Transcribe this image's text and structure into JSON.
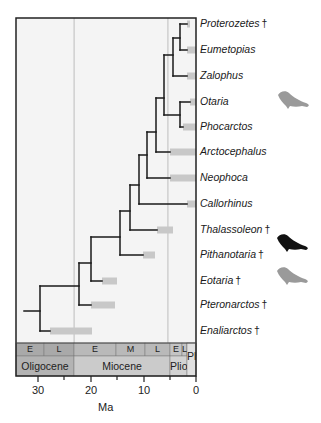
{
  "figure": {
    "type": "phylogenetic-tree",
    "frame": {
      "left": 16,
      "right": 196,
      "top": 18,
      "bottom": 343
    },
    "scale": {
      "x0_px": 196,
      "px_per_ma": 5.3
    },
    "boundary_lines_ma": [
      23.0,
      5.3
    ],
    "colors": {
      "branch": "#1a1a1a",
      "range_bar": "#c8c8c8",
      "frame_fill": "#f4f4f4",
      "boundary_line": "#b0b0b0",
      "silhouette_grey": "#9a9a9a",
      "silhouette_black": "#111111"
    }
  },
  "taxa": [
    {
      "name": "Proterozetes",
      "extinct": true,
      "y": 24,
      "bar": [
        187,
        190
      ]
    },
    {
      "name": "Eumetopias",
      "extinct": false,
      "y": 50,
      "bar": [
        187,
        196
      ]
    },
    {
      "name": "Zalophus",
      "extinct": false,
      "y": 76,
      "bar": [
        187,
        196
      ]
    },
    {
      "name": "Otaria",
      "extinct": false,
      "y": 102,
      "bar": [
        190,
        196
      ]
    },
    {
      "name": "Phocarctos",
      "extinct": false,
      "y": 127,
      "bar": [
        183,
        196
      ]
    },
    {
      "name": "Arctocephalus",
      "extinct": false,
      "y": 152,
      "bar": [
        170,
        196
      ]
    },
    {
      "name": "Neophoca",
      "extinct": false,
      "y": 178,
      "bar": [
        170,
        196
      ]
    },
    {
      "name": "Callorhinus",
      "extinct": false,
      "y": 204,
      "bar": [
        187,
        196
      ]
    },
    {
      "name": "Thalassoleon",
      "extinct": true,
      "y": 230,
      "bar": [
        157,
        173
      ]
    },
    {
      "name": "Pithanotaria",
      "extinct": true,
      "y": 255,
      "bar": [
        143,
        155
      ]
    },
    {
      "name": "Eotaria",
      "extinct": true,
      "y": 281,
      "bar": [
        102,
        117
      ]
    },
    {
      "name": "Pteronarctos",
      "extinct": true,
      "y": 305,
      "bar": [
        91,
        115
      ]
    },
    {
      "name": "Enaliarctos",
      "extinct": true,
      "y": 331,
      "bar": [
        50,
        92
      ]
    }
  ],
  "branches": [
    {
      "x1": 24,
      "y1": 311,
      "x2": 40,
      "y2": 311
    },
    {
      "x1": 40,
      "y1": 286,
      "x2": 40,
      "y2": 331
    },
    {
      "x1": 40,
      "y1": 331,
      "x2": 50,
      "y2": 331
    },
    {
      "x1": 40,
      "y1": 286,
      "x2": 79,
      "y2": 286
    },
    {
      "x1": 79,
      "y1": 263,
      "x2": 79,
      "y2": 305
    },
    {
      "x1": 79,
      "y1": 305,
      "x2": 91,
      "y2": 305
    },
    {
      "x1": 79,
      "y1": 263,
      "x2": 91,
      "y2": 263
    },
    {
      "x1": 91,
      "y1": 237,
      "x2": 91,
      "y2": 281
    },
    {
      "x1": 91,
      "y1": 281,
      "x2": 102,
      "y2": 281
    },
    {
      "x1": 91,
      "y1": 237,
      "x2": 120,
      "y2": 237
    },
    {
      "x1": 120,
      "y1": 211,
      "x2": 120,
      "y2": 255
    },
    {
      "x1": 120,
      "y1": 255,
      "x2": 143,
      "y2": 255
    },
    {
      "x1": 120,
      "y1": 211,
      "x2": 130,
      "y2": 211
    },
    {
      "x1": 130,
      "y1": 185,
      "x2": 130,
      "y2": 230
    },
    {
      "x1": 130,
      "y1": 230,
      "x2": 157,
      "y2": 230
    },
    {
      "x1": 130,
      "y1": 185,
      "x2": 139,
      "y2": 185
    },
    {
      "x1": 139,
      "y1": 155,
      "x2": 139,
      "y2": 204
    },
    {
      "x1": 139,
      "y1": 204,
      "x2": 187,
      "y2": 204
    },
    {
      "x1": 139,
      "y1": 155,
      "x2": 147,
      "y2": 155
    },
    {
      "x1": 147,
      "y1": 132,
      "x2": 147,
      "y2": 178
    },
    {
      "x1": 147,
      "y1": 178,
      "x2": 170,
      "y2": 178
    },
    {
      "x1": 147,
      "y1": 132,
      "x2": 156,
      "y2": 132
    },
    {
      "x1": 156,
      "y1": 98,
      "x2": 156,
      "y2": 152
    },
    {
      "x1": 156,
      "y1": 152,
      "x2": 170,
      "y2": 152
    },
    {
      "x1": 156,
      "y1": 98,
      "x2": 164,
      "y2": 98
    },
    {
      "x1": 164,
      "y1": 55,
      "x2": 164,
      "y2": 115
    },
    {
      "x1": 164,
      "y1": 115,
      "x2": 180,
      "y2": 115
    },
    {
      "x1": 180,
      "y1": 102,
      "x2": 180,
      "y2": 127
    },
    {
      "x1": 180,
      "y1": 102,
      "x2": 190,
      "y2": 102
    },
    {
      "x1": 180,
      "y1": 127,
      "x2": 183,
      "y2": 127
    },
    {
      "x1": 164,
      "y1": 55,
      "x2": 173,
      "y2": 55
    },
    {
      "x1": 173,
      "y1": 38,
      "x2": 173,
      "y2": 76
    },
    {
      "x1": 173,
      "y1": 76,
      "x2": 187,
      "y2": 76
    },
    {
      "x1": 173,
      "y1": 38,
      "x2": 180,
      "y2": 38
    },
    {
      "x1": 180,
      "y1": 24,
      "x2": 180,
      "y2": 50
    },
    {
      "x1": 180,
      "y1": 24,
      "x2": 187,
      "y2": 24
    },
    {
      "x1": 180,
      "y1": 50,
      "x2": 187,
      "y2": 50
    }
  ],
  "timescale": {
    "subepochs": [
      {
        "label": "E",
        "x1": 16,
        "x2": 44,
        "color": "#a9a9a9"
      },
      {
        "label": "L",
        "x1": 44,
        "x2": 74,
        "color": "#a9a9a9"
      },
      {
        "label": "E",
        "x1": 74,
        "x2": 116,
        "color": "#b9b9b9"
      },
      {
        "label": "M",
        "x1": 116,
        "x2": 145,
        "color": "#b9b9b9"
      },
      {
        "label": "L",
        "x1": 145,
        "x2": 170,
        "color": "#b9b9b9"
      },
      {
        "label": "E",
        "x1": 170,
        "x2": 182,
        "color": "#c4c4c4"
      },
      {
        "label": "L",
        "x1": 182,
        "x2": 187,
        "color": "#c4c4c4"
      }
    ],
    "epochs": [
      {
        "label": "Oligocene",
        "x1": 16,
        "x2": 74,
        "color": "#b3b3b3"
      },
      {
        "label": "Miocene",
        "x1": 74,
        "x2": 170,
        "color": "#cbcbcb"
      },
      {
        "label": "Plio",
        "x1": 170,
        "x2": 187,
        "color": "#d3d3d3"
      },
      {
        "label": "Pl",
        "x1": 187,
        "x2": 196,
        "color": "#e0e0e0"
      }
    ]
  },
  "axis": {
    "title": "Ma",
    "ticks": [
      {
        "label": "30",
        "x": 38
      },
      {
        "label": "20",
        "x": 91
      },
      {
        "label": "10",
        "x": 144
      },
      {
        "label": "0",
        "x": 196
      }
    ],
    "minor_ticks_x": [
      64,
      117,
      170
    ]
  },
  "silhouettes": [
    {
      "name": "sea-lion-grey-top",
      "x": 276,
      "y": 89,
      "color": "#9a9a9a"
    },
    {
      "name": "fur-seal-black",
      "x": 275,
      "y": 232,
      "color": "#111111"
    },
    {
      "name": "sea-lion-grey-bottom",
      "x": 275,
      "y": 265,
      "color": "#9a9a9a"
    }
  ]
}
